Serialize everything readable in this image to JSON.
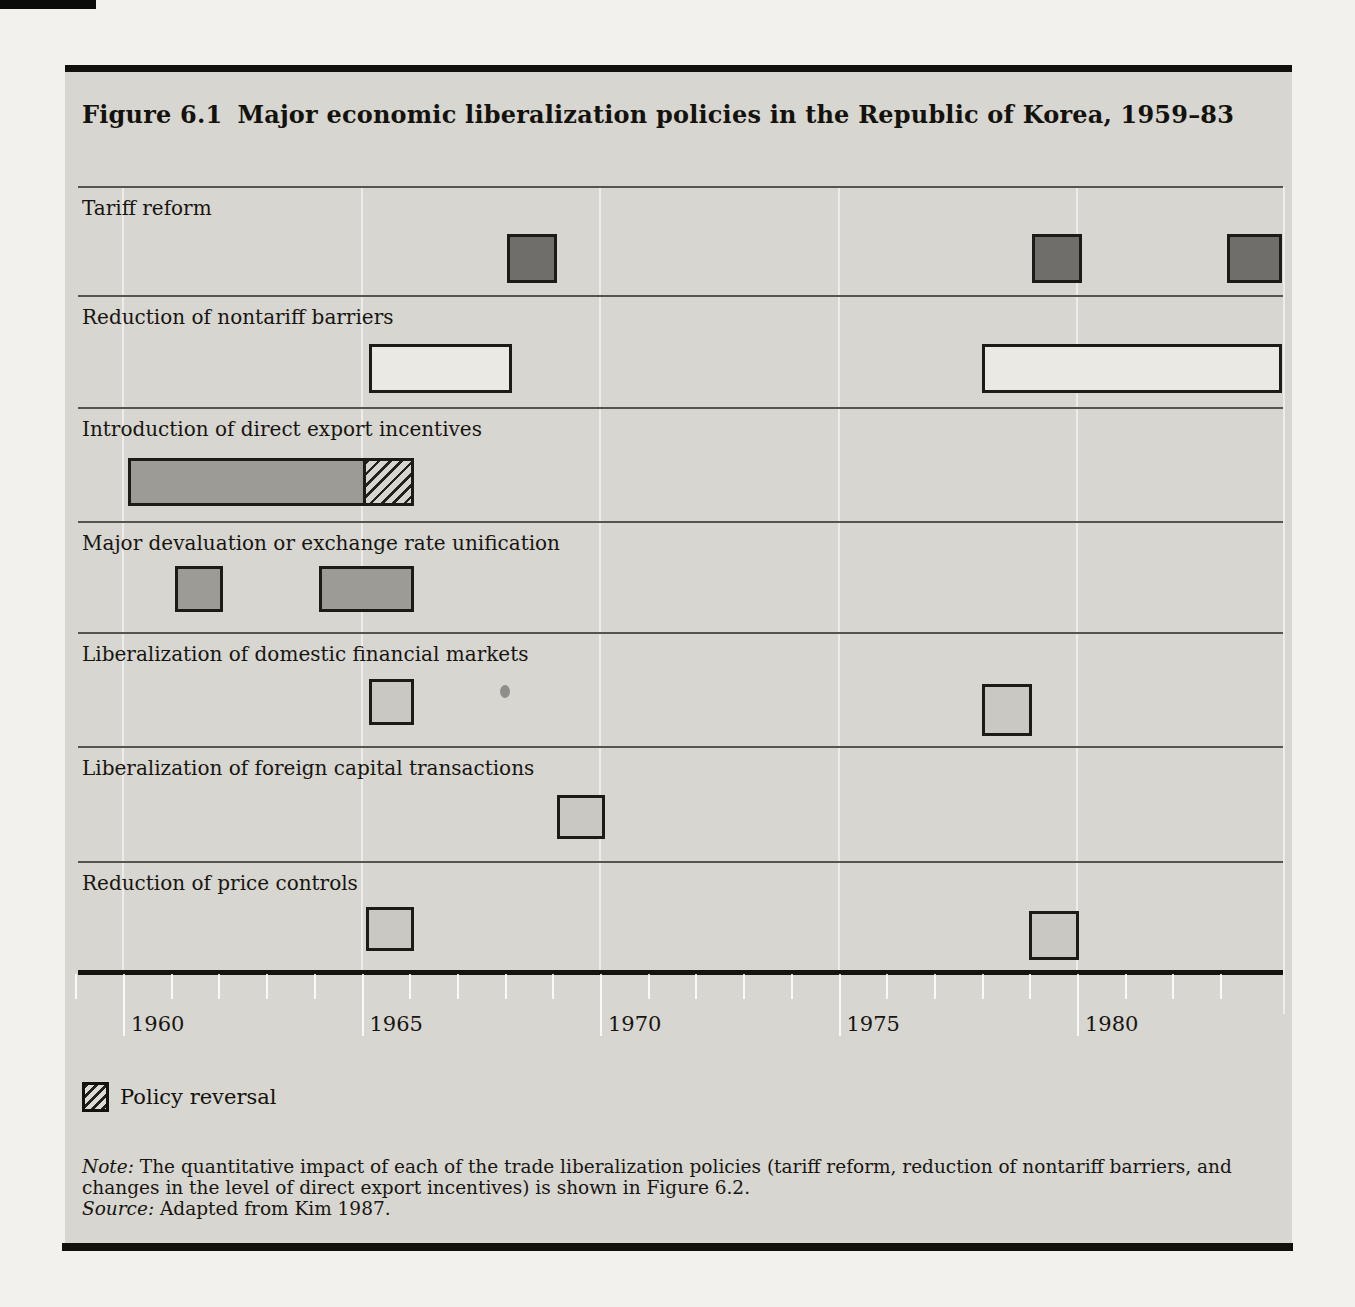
{
  "figure": {
    "title_label": "Figure 6.1",
    "title_text": "Major economic liberalization policies in the Republic of Korea, 1959–83",
    "legend": {
      "symbol": "hatch-swatch",
      "label": "Policy reversal"
    },
    "note_label": "Note:",
    "note_text": " The quantitative impact of each of the trade liberalization policies (tariff reform, reduction of nontariff barriers, and changes in the level of direct export incentives) is shown in Figure 6.2.",
    "source_label": "Source:",
    "source_text": " Adapted from Kim 1987."
  },
  "chart_data": {
    "type": "bar",
    "subtype": "gantt-timeline",
    "xlabel": "Year",
    "x_range": [
      1959,
      1984.3
    ],
    "tick_year_range": [
      1959,
      1983
    ],
    "major_tick_years": [
      1960,
      1965,
      1970,
      1975,
      1980
    ],
    "gridline_years": [
      1960,
      1965,
      1970,
      1975,
      1980
    ],
    "axis_tick_labels": [
      "1960",
      "1965",
      "1970",
      "1975",
      "1980"
    ],
    "grid": "faint-vertical-major-years",
    "legend_position": "below-left",
    "legend": {
      "hatch": "Policy reversal"
    },
    "rows": [
      {
        "label": "Tariff reform",
        "bars": [
          {
            "start": 1968.05,
            "end": 1969.1,
            "style": "dark"
          },
          {
            "start": 1979.05,
            "end": 1980.1,
            "style": "dark"
          },
          {
            "start": 1983.15,
            "end": 1984.3,
            "style": "dark",
            "clipped": true
          }
        ]
      },
      {
        "label": "Reduction of nontariff barriers",
        "bars": [
          {
            "start": 1965.15,
            "end": 1968.15,
            "style": "white"
          },
          {
            "start": 1978.0,
            "end": 1984.3,
            "style": "white",
            "clipped": true
          }
        ]
      },
      {
        "label": "Introduction of direct export incentives",
        "bars": [
          {
            "start": 1960.1,
            "end": 1965.1,
            "style": "medium"
          },
          {
            "start": 1965.1,
            "end": 1966.1,
            "style": "hatch",
            "meaning": "policy reversal"
          }
        ]
      },
      {
        "label": "Major devaluation or exchange rate unification",
        "bars": [
          {
            "start": 1961.1,
            "end": 1962.1,
            "style": "medium"
          },
          {
            "start": 1964.1,
            "end": 1966.1,
            "style": "medium"
          }
        ]
      },
      {
        "label": "Liberalization of domestic financial markets",
        "bars": [
          {
            "start": 1965.15,
            "end": 1966.1,
            "style": "light"
          },
          {
            "start": 1978.0,
            "end": 1979.05,
            "style": "light",
            "top": 684,
            "h": 52
          }
        ]
      },
      {
        "label": "Liberalization of foreign capital transactions",
        "bars": [
          {
            "start": 1969.1,
            "end": 1970.1,
            "style": "light"
          }
        ]
      },
      {
        "label": "Reduction of price controls",
        "bars": [
          {
            "start": 1965.1,
            "end": 1966.1,
            "style": "light"
          },
          {
            "start": 1979.0,
            "end": 1980.05,
            "style": "light",
            "top": 911,
            "h": 49
          }
        ]
      }
    ],
    "layout": {
      "plot_left_px": 78,
      "plot_right_px": 1283,
      "year1960_px": 123,
      "px_per_year": 47.7,
      "row_line_y_px": [
        186,
        295,
        407,
        521,
        632,
        746,
        861
      ],
      "axis_y_px": 970,
      "bar_geometry": [
        {
          "top": 234,
          "h": 49
        },
        {
          "top": 344,
          "h": 49
        },
        {
          "top": 458,
          "h": 48
        },
        {
          "top": 566,
          "h": 46
        },
        {
          "top": 679,
          "h": 46
        },
        {
          "top": 795,
          "h": 44
        },
        {
          "top": 907,
          "h": 44
        }
      ]
    },
    "colors": {
      "dark": "#6f6e6b",
      "medium": "#9d9b96",
      "light": "#c9c8c3",
      "white": "#eae9e4",
      "panel_bg": "#d8d6d1",
      "rule": "#12110d"
    }
  }
}
